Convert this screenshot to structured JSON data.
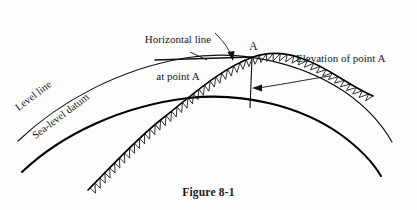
{
  "figure": {
    "caption": "Figure 8-1",
    "point_label": "A",
    "labels": {
      "horizontal_line": "Horizontal line\nat point A",
      "horizontal_line_l1": "Horizontal line",
      "horizontal_line_l2": "at point A",
      "elevation": "Elevation of point A",
      "level_line": "Level line",
      "sea_level_datum": "Sea-level datum"
    },
    "colors": {
      "ink": "#1a1a1a",
      "line": "#000000",
      "background": "#fdfdfd"
    },
    "icons": {
      "leader_arrow": "curved-arrow-icon",
      "elevation_arrow": "left-arrow-icon",
      "terrain": "hatched-ground-icon"
    }
  }
}
